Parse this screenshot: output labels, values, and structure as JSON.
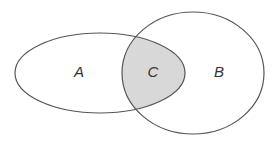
{
  "diagram": {
    "type": "venn",
    "sets": [
      {
        "id": "A",
        "label": "A",
        "shape": "ellipse",
        "cx": 100,
        "cy": 73,
        "rx": 85,
        "ry": 40
      },
      {
        "id": "B",
        "label": "B",
        "shape": "ellipse",
        "cx": 193,
        "cy": 73,
        "rx": 71,
        "ry": 61
      }
    ],
    "intersection": {
      "id": "C",
      "label": "C",
      "fill": "#d8d8d8"
    },
    "colors": {
      "stroke": "#555555",
      "background": "#ffffff",
      "intersection_fill": "#d8d8d8"
    }
  }
}
